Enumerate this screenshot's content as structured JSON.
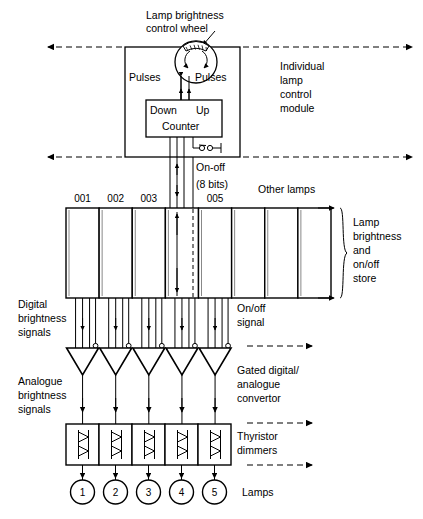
{
  "labels": {
    "control_wheel": "Lamp brightness",
    "control_wheel_2": "control wheel",
    "pulses_left": "Pulses",
    "pulses_right": "Pulses",
    "counter_down": "Down",
    "counter_up": "Up",
    "counter_name": "Counter",
    "module_1": "Individual",
    "module_2": "lamp",
    "module_3": "control",
    "module_4": "module",
    "onoff": "On-off",
    "bits": "(8 bits)",
    "other_lamps": "Other  lamps",
    "store_1": "Lamp",
    "store_2": "brightness",
    "store_3": "and",
    "store_4": "on/off",
    "store_5": "store",
    "digital_1": "Digital",
    "digital_2": "brightness",
    "digital_3": "signals",
    "onoff_signal_1": "On/off",
    "onoff_signal_2": "signal",
    "analogue_1": "Analogue",
    "analogue_2": "brightness",
    "analogue_3": "signals",
    "convertor_1": "Gated digital/",
    "convertor_2": "analogue",
    "convertor_3": "convertor",
    "thyristor_1": "Thyristor",
    "thyristor_2": "dimmers",
    "lamps": "Lamps"
  },
  "store_cells": [
    {
      "id": "001",
      "show_label": true
    },
    {
      "id": "002",
      "show_label": true
    },
    {
      "id": "003",
      "show_label": true
    },
    {
      "id": "004",
      "show_label": false
    },
    {
      "id": "005",
      "show_label": true
    },
    {
      "id": "006",
      "show_label": false
    },
    {
      "id": "007",
      "show_label": false
    },
    {
      "id": "008",
      "show_label": false
    }
  ],
  "lamps": [
    "1",
    "2",
    "3",
    "4",
    "5"
  ],
  "colors": {
    "line": "#000000",
    "background": "#ffffff",
    "shadow": "#777777"
  }
}
